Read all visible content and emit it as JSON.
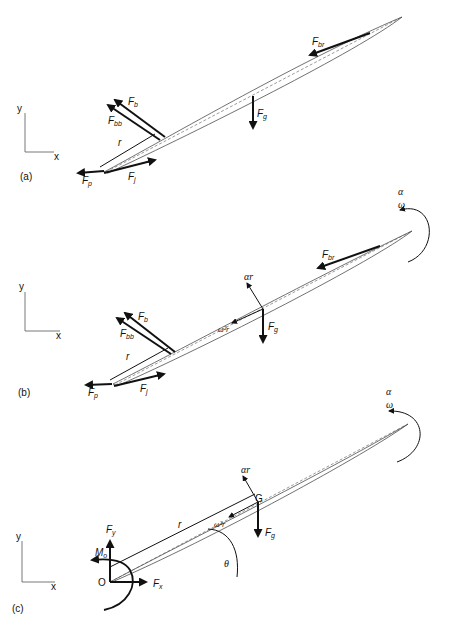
{
  "panels": [
    {
      "id": "a",
      "label": "(a)",
      "axes": {
        "x": "x",
        "y": "y"
      },
      "forces": {
        "Fb": {
          "main": "F",
          "sub": "b"
        },
        "Fbb": {
          "main": "F",
          "sub": "bb"
        },
        "Fbr": {
          "main": "F",
          "sub": "br"
        },
        "Fg": {
          "main": "F",
          "sub": "g"
        },
        "Fp": {
          "main": "F",
          "sub": "p"
        },
        "Fj": {
          "main": "F",
          "sub": "j"
        }
      },
      "r": "r"
    },
    {
      "id": "b",
      "label": "(b)",
      "axes": {
        "x": "x",
        "y": "y"
      },
      "forces": {
        "Fb": {
          "main": "F",
          "sub": "b"
        },
        "Fbb": {
          "main": "F",
          "sub": "bb"
        },
        "Fbr": {
          "main": "F",
          "sub": "br"
        },
        "Fg": {
          "main": "F",
          "sub": "g"
        },
        "Fp": {
          "main": "F",
          "sub": "p"
        },
        "Fj": {
          "main": "F",
          "sub": "j"
        }
      },
      "r": "r",
      "alpha_r": "αr",
      "omega2_r": "ω²r",
      "alpha": "α",
      "omega": "ω"
    },
    {
      "id": "c",
      "label": "(c)",
      "axes": {
        "x": "x",
        "y": "y"
      },
      "forces": {
        "Fx": {
          "main": "F",
          "sub": "x"
        },
        "Fy": {
          "main": "F",
          "sub": "y"
        },
        "Mo": {
          "main": "M",
          "sub": "o"
        },
        "Fg": {
          "main": "F",
          "sub": "g"
        }
      },
      "origin": "O",
      "cg": "G",
      "r": "r",
      "theta": "θ",
      "alpha_r": "αr",
      "omega2_r": "ω²r",
      "alpha": "α",
      "omega": "ω"
    }
  ]
}
